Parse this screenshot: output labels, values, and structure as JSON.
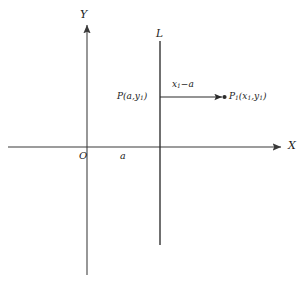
{
  "figure": {
    "background_color": "#ffffff",
    "stroke_color": "#3a3a3a",
    "text_color": "#1a1a1a",
    "width": 304,
    "height": 283
  },
  "axes": {
    "x_axis_label": "X",
    "y_axis_label": "Y",
    "origin_label": "O",
    "x_tick_label": "a"
  },
  "line": {
    "label": "L"
  },
  "points": {
    "p": {
      "label_main": "P",
      "label_args": "(a,y",
      "label_sub": "1",
      "label_close": ")"
    },
    "p1": {
      "label_main": "P",
      "label_sub_main": "1",
      "label_open": "(x",
      "label_sub_x": "1",
      "label_comma": ",y",
      "label_sub_y": "1",
      "label_close": ")"
    }
  },
  "segment": {
    "label_x": "x",
    "label_sub": "1",
    "label_rest": "−a"
  }
}
